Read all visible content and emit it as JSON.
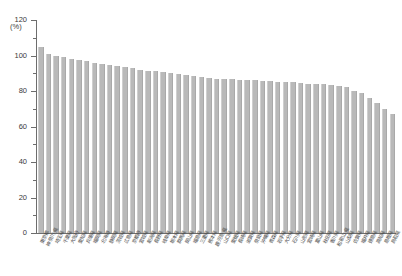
{
  "chart_data": {
    "type": "bar",
    "title": "",
    "subtitle": "",
    "xlabel": "",
    "ylabel": "",
    "unit_label": "(%)",
    "ylim": [
      0,
      120
    ],
    "ytick_major": [
      0,
      20,
      40,
      60,
      80,
      100,
      120
    ],
    "ytick_major_labels": [
      "0",
      "20",
      "40",
      "60",
      "80",
      "100",
      "120"
    ],
    "ytick_minor": [
      10,
      30,
      50,
      70,
      90,
      110
    ],
    "grid": false,
    "legend": null,
    "bar_color": "#b9b9b9",
    "axis_color": "#6d6d6d",
    "categories": [
      "東京都",
      "神奈川県",
      "埼玉県",
      "千葉県",
      "大阪府",
      "愛知県",
      "兵庫県",
      "福岡県",
      "北海道",
      "静岡県",
      "茨城県",
      "広島県",
      "京都府",
      "宮城県",
      "新潟県",
      "長野県",
      "岐阜県",
      "栃木県",
      "群馬県",
      "岡山県",
      "福島県",
      "三重県",
      "熊本県",
      "鹿児島県",
      "山口県",
      "愛媛県",
      "長崎県",
      "滋賀県",
      "奈良県",
      "沖縄県",
      "青森県",
      "岩手県",
      "大分県",
      "石川県",
      "山形県",
      "宮崎県",
      "富山県",
      "秋田県",
      "香川県",
      "和歌山県",
      "山梨県",
      "佐賀県",
      "福井県",
      "徳島県",
      "高知県",
      "島根県",
      "鳥取県"
    ],
    "values": [
      105,
      101,
      100,
      99,
      98,
      97.5,
      97,
      96,
      95,
      94.5,
      94,
      93.5,
      93,
      92,
      91.5,
      91,
      90.5,
      90,
      89.5,
      89,
      88.5,
      88,
      87.5,
      87,
      87,
      86.5,
      86,
      86,
      86,
      85.5,
      85.5,
      85,
      85,
      85,
      84.5,
      84,
      84,
      84,
      83.5,
      83,
      82,
      80,
      79,
      76,
      73,
      70,
      67
    ]
  }
}
